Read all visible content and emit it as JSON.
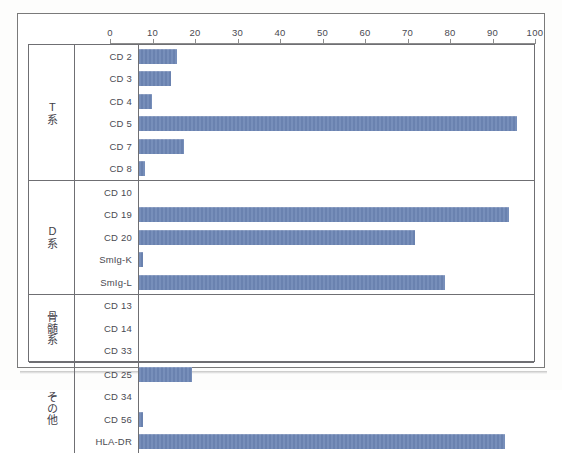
{
  "figure": {
    "frame_color": "#7a7a7a",
    "bar_color": "#6d86b5",
    "grid_color": "#6f6f73",
    "text_color": "#4a4a52"
  },
  "chart_data": {
    "type": "bar",
    "orientation": "horizontal",
    "title": "",
    "subtitle": "",
    "xlabel": "",
    "ylabel": "",
    "xlim": [
      0,
      100
    ],
    "xticks": [
      0,
      10,
      20,
      30,
      40,
      50,
      60,
      70,
      80,
      90,
      100
    ],
    "xtick_labels": [
      "0",
      "10",
      "20",
      "30",
      "40",
      "50",
      "60",
      "70",
      "80",
      "90",
      "100"
    ],
    "grid": false,
    "legend": null,
    "groups": [
      {
        "label": "T系",
        "categories": [
          "CD 2",
          "CD 3",
          "CD 4",
          "CD 5",
          "CD 7",
          "CD 8"
        ],
        "values": [
          9,
          7.5,
          3,
          89,
          10.5,
          1.5
        ]
      },
      {
        "label": "D系",
        "categories": [
          "CD 10",
          "CD 19",
          "CD 20",
          "SmIg-K",
          "SmIg-L"
        ],
        "values": [
          0,
          87,
          65,
          1,
          72
        ]
      },
      {
        "label": "骨髄系",
        "categories": [
          "CD 13",
          "CD 14",
          "CD 33"
        ],
        "values": [
          0,
          0,
          0
        ]
      },
      {
        "label": "その他",
        "categories": [
          "CD 25",
          "CD 34",
          "CD 56",
          "HLA-DR"
        ],
        "values": [
          12.5,
          0,
          1,
          86
        ]
      }
    ],
    "categories": [
      "CD 2",
      "CD 3",
      "CD 4",
      "CD 5",
      "CD 7",
      "CD 8",
      "CD 10",
      "CD 19",
      "CD 20",
      "SmIg-K",
      "SmIg-L",
      "CD 13",
      "CD 14",
      "CD 33",
      "CD 25",
      "CD 34",
      "CD 56",
      "HLA-DR"
    ],
    "values": [
      9,
      7.5,
      3,
      89,
      10.5,
      1.5,
      0,
      87,
      65,
      1,
      72,
      0,
      0,
      0,
      12.5,
      0,
      1,
      86
    ]
  }
}
